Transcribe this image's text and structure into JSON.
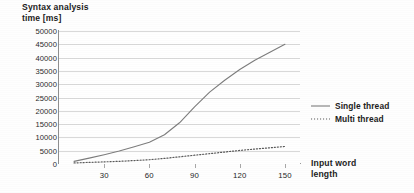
{
  "chart_data": {
    "type": "line",
    "title": "Syntax analysis\ntime [ms]",
    "ylabel": "Syntax analysis time [ms]",
    "xlabel": "Input word\nlength",
    "grid": true,
    "legend_position": "right",
    "xlim": [
      0,
      160
    ],
    "ylim": [
      0,
      50000
    ],
    "y_ticks": [
      50000,
      45000,
      40000,
      35000,
      30000,
      25000,
      20000,
      15000,
      10000,
      5000,
      0
    ],
    "y_tick_labels": [
      "50000",
      "45000",
      "40000",
      "35000",
      "30000",
      "25000",
      "20000",
      "15000",
      "10000",
      "5000",
      "0"
    ],
    "x_ticks": [
      30,
      60,
      90,
      120,
      150
    ],
    "x_tick_labels": [
      "30",
      "60",
      "90",
      "120",
      "150"
    ],
    "x": [
      10,
      20,
      30,
      40,
      50,
      60,
      70,
      80,
      90,
      100,
      110,
      120,
      130,
      140,
      150
    ],
    "series": [
      {
        "name": "Single thread",
        "style": "solid",
        "color": "#7d7d7d",
        "values": [
          1000,
          2200,
          3500,
          4900,
          6500,
          8200,
          11000,
          15500,
          21500,
          27000,
          31500,
          35500,
          39000,
          42000,
          45000
        ]
      },
      {
        "name": "Multi thread",
        "style": "dotted",
        "color": "#5a5a5a",
        "values": [
          400,
          600,
          800,
          1000,
          1300,
          1600,
          2100,
          2700,
          3300,
          3900,
          4500,
          5100,
          5600,
          6100,
          6600
        ]
      }
    ]
  },
  "legend": {
    "items": [
      {
        "label": "Single thread",
        "style": "solid"
      },
      {
        "label": "Multi thread",
        "style": "dotted"
      }
    ]
  },
  "colors": {
    "grid": "#d9d9d9",
    "axis": "#9a9a9a",
    "single_thread": "#7d7d7d",
    "multi_thread": "#5a5a5a",
    "text": "#1c1c1c",
    "background": "#ffffff"
  }
}
